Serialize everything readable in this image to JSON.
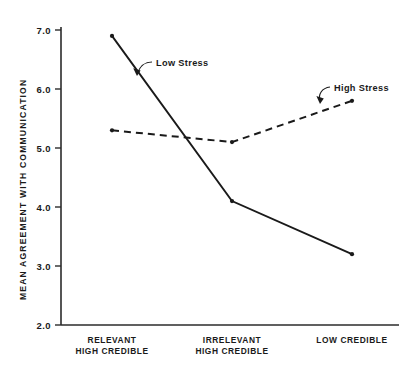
{
  "chart_data": {
    "type": "line",
    "title": "",
    "xlabel": "",
    "ylabel": "MEAN AGREEMENT WITH COMMUNICATION",
    "categories": [
      "RELEVANT HIGH CREDIBLE",
      "IRRELEVANT HIGH CREDIBLE",
      "LOW CREDIBLE"
    ],
    "category_lines": [
      [
        "RELEVANT",
        "HIGH CREDIBLE"
      ],
      [
        "IRRELEVANT",
        "HIGH CREDIBLE"
      ],
      [
        "LOW CREDIBLE",
        ""
      ]
    ],
    "series": [
      {
        "name": "Low Stress",
        "style": "solid",
        "values": [
          6.9,
          4.1,
          3.2
        ]
      },
      {
        "name": "High Stress",
        "style": "dashed",
        "values": [
          5.3,
          5.1,
          5.8
        ]
      }
    ],
    "ylim": [
      2.0,
      7.0
    ],
    "ytick_values": [
      2.0,
      3.0,
      4.0,
      5.0,
      6.0,
      7.0
    ],
    "ytick_labels": [
      "2.0",
      "3.0",
      "4.0",
      "5.0",
      "6.0",
      "7.0"
    ],
    "grid": false,
    "legend": "inline-annotations",
    "annotations": [
      {
        "text": "Low Stress",
        "target_series": "Low Stress"
      },
      {
        "text": "High Stress",
        "target_series": "High Stress"
      }
    ],
    "colors": {
      "line": "#1a1a1a",
      "axis": "#2b2b2b",
      "background": "#ffffff"
    }
  },
  "axis": {
    "y_title": "MEAN AGREEMENT WITH COMMUNICATION",
    "ticks": {
      "t7": "7.0",
      "t6": "6.0",
      "t5": "5.0",
      "t4": "4.0",
      "t3": "3.0",
      "t2": "2.0"
    }
  },
  "categories": {
    "c1_line1": "RELEVANT",
    "c1_line2": "HIGH CREDIBLE",
    "c2_line1": "IRRELEVANT",
    "c2_line2": "HIGH CREDIBLE",
    "c3_line1": "LOW CREDIBLE"
  },
  "annotations": {
    "low_stress": "Low Stress",
    "high_stress": "High Stress"
  }
}
